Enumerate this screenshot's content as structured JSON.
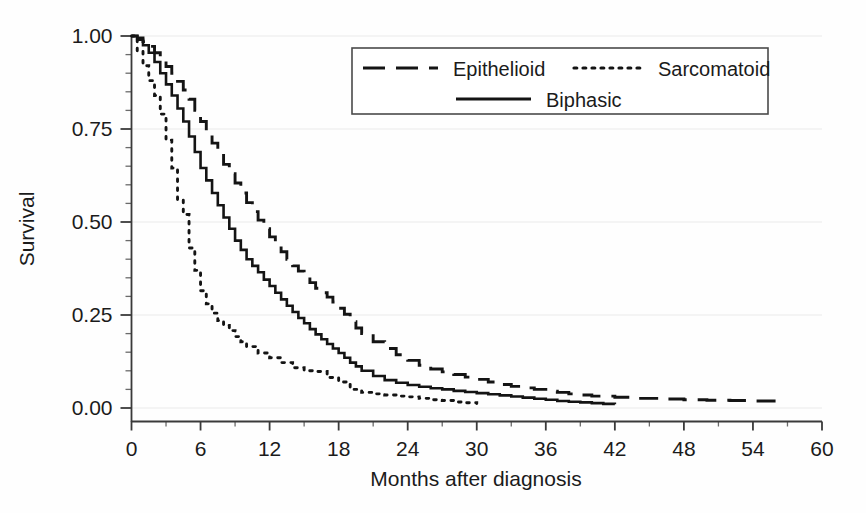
{
  "chart_data": {
    "type": "line",
    "title": "",
    "subtitle": "",
    "xlabel": "Months after diagnosis",
    "ylabel": "Survival",
    "xlim": [
      0,
      60
    ],
    "ylim": [
      0.0,
      1.0
    ],
    "xticks": [
      0,
      6,
      12,
      18,
      24,
      30,
      36,
      42,
      48,
      54,
      60
    ],
    "xtick_labels": [
      "0",
      "6",
      "12",
      "18",
      "24",
      "30",
      "36",
      "42",
      "48",
      "54",
      "60"
    ],
    "yticks": [
      0.0,
      0.25,
      0.5,
      0.75,
      1.0
    ],
    "ytick_labels": [
      "0.00",
      "0.25",
      "0.50",
      "0.75",
      "1.00"
    ],
    "x_minor_tick_step": 3,
    "y_minor_tick_step": 0.05,
    "grid": "horizontal-major-faint",
    "legend_position": "upper-center",
    "plot_kind": "kaplan-meier-survival",
    "series": [
      {
        "name": "Epithelioid",
        "style": "dashed",
        "color": "#141414",
        "x": [
          0,
          0.5,
          1,
          1.5,
          2,
          2.5,
          3,
          3.5,
          4,
          4.5,
          5,
          5.5,
          6,
          6.5,
          7,
          7.5,
          8,
          8.5,
          9,
          9.5,
          10,
          10.5,
          11,
          11.5,
          12,
          12.5,
          13,
          13.5,
          14,
          14.5,
          15,
          15.5,
          16,
          16.5,
          17,
          17.5,
          18,
          18.5,
          19,
          19.5,
          20,
          21,
          22,
          23,
          24,
          25,
          26,
          27,
          28,
          29,
          30,
          31,
          32,
          33,
          34,
          35,
          36,
          37,
          38,
          39,
          40,
          42,
          44,
          46,
          48,
          50,
          52,
          54,
          56
        ],
        "y": [
          1.0,
          0.995,
          0.985,
          0.972,
          0.955,
          0.938,
          0.918,
          0.9,
          0.878,
          0.855,
          0.83,
          0.8,
          0.77,
          0.74,
          0.712,
          0.685,
          0.655,
          0.63,
          0.605,
          0.578,
          0.552,
          0.528,
          0.505,
          0.482,
          0.46,
          0.44,
          0.42,
          0.4,
          0.382,
          0.368,
          0.352,
          0.337,
          0.322,
          0.31,
          0.298,
          0.285,
          0.268,
          0.252,
          0.232,
          0.215,
          0.2,
          0.178,
          0.16,
          0.143,
          0.128,
          0.115,
          0.105,
          0.097,
          0.09,
          0.083,
          0.077,
          0.07,
          0.063,
          0.058,
          0.054,
          0.05,
          0.045,
          0.042,
          0.038,
          0.035,
          0.032,
          0.029,
          0.026,
          0.024,
          0.022,
          0.021,
          0.02,
          0.019,
          0.018
        ]
      },
      {
        "name": "Sarcomatoid",
        "style": "dotted",
        "color": "#141414",
        "x": [
          0,
          0.5,
          1,
          1.5,
          2,
          2.5,
          3,
          3.5,
          4,
          4.5,
          5,
          5.5,
          6,
          6.5,
          7,
          7.5,
          8,
          8.5,
          9,
          9.5,
          10,
          11,
          12,
          13,
          14,
          15,
          16,
          17,
          18,
          19,
          20,
          21,
          22,
          23,
          24,
          25,
          26,
          27,
          28,
          29,
          30
        ],
        "y": [
          1.0,
          0.96,
          0.92,
          0.88,
          0.84,
          0.79,
          0.72,
          0.645,
          0.56,
          0.52,
          0.43,
          0.37,
          0.315,
          0.28,
          0.255,
          0.235,
          0.222,
          0.208,
          0.192,
          0.178,
          0.165,
          0.148,
          0.135,
          0.122,
          0.108,
          0.1,
          0.098,
          0.082,
          0.07,
          0.05,
          0.042,
          0.038,
          0.035,
          0.032,
          0.03,
          0.026,
          0.022,
          0.02,
          0.016,
          0.014,
          0.012
        ]
      },
      {
        "name": "Biphasic",
        "style": "solid",
        "color": "#141414",
        "x": [
          0,
          0.5,
          1,
          1.5,
          2,
          2.5,
          3,
          3.5,
          4,
          4.5,
          5,
          5.5,
          6,
          6.5,
          7,
          7.5,
          8,
          8.5,
          9,
          9.5,
          10,
          10.5,
          11,
          11.5,
          12,
          12.5,
          13,
          13.5,
          14,
          14.5,
          15,
          15.5,
          16,
          16.5,
          17,
          17.5,
          18,
          18.5,
          19,
          19.5,
          20,
          21,
          22,
          23,
          24,
          25,
          26,
          27,
          28,
          29,
          30,
          31,
          32,
          33,
          34,
          35,
          36,
          37,
          38,
          39,
          40,
          41,
          42
        ],
        "y": [
          1.0,
          0.99,
          0.975,
          0.955,
          0.93,
          0.9,
          0.87,
          0.84,
          0.805,
          0.77,
          0.73,
          0.688,
          0.645,
          0.612,
          0.578,
          0.545,
          0.512,
          0.482,
          0.45,
          0.425,
          0.4,
          0.382,
          0.365,
          0.345,
          0.328,
          0.31,
          0.292,
          0.275,
          0.258,
          0.242,
          0.228,
          0.212,
          0.198,
          0.185,
          0.172,
          0.16,
          0.148,
          0.135,
          0.122,
          0.112,
          0.1,
          0.086,
          0.075,
          0.068,
          0.062,
          0.057,
          0.053,
          0.05,
          0.046,
          0.043,
          0.04,
          0.037,
          0.034,
          0.031,
          0.028,
          0.025,
          0.022,
          0.019,
          0.017,
          0.015,
          0.013,
          0.011,
          0.01
        ]
      }
    ]
  },
  "legend": {
    "entries": [
      {
        "label": "Epithelioid",
        "style": "dashed"
      },
      {
        "label": "Sarcomatoid",
        "style": "dotted"
      },
      {
        "label": "Biphasic",
        "style": "solid"
      }
    ]
  },
  "axes": {
    "x_title": "Months after diagnosis",
    "y_title": "Survival"
  }
}
